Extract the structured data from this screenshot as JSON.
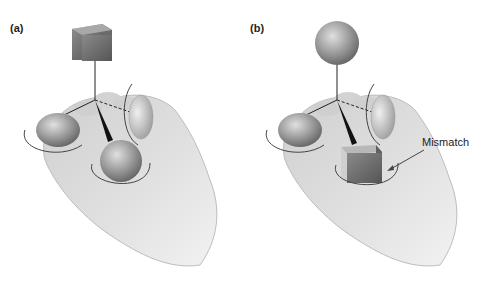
{
  "figure": {
    "panels": [
      {
        "label": "(a)",
        "top_object": "cube",
        "palm_object": "sphere",
        "finger_objects": [
          "ellipsoid-left",
          "lens-right"
        ]
      },
      {
        "label": "(b)",
        "top_object": "sphere",
        "palm_object": "cube",
        "finger_objects": [
          "ellipsoid-left",
          "lens-right"
        ],
        "annotation": "Mismatch"
      }
    ],
    "colors": {
      "hand": "#d9d9d9",
      "hand_shadow": "#b5b5b5",
      "object": "#8c8c8c",
      "line": "#222222"
    }
  }
}
